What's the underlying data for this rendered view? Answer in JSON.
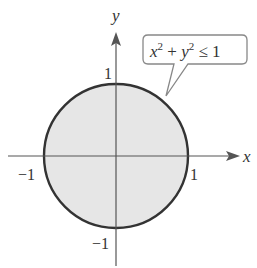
{
  "diagram": {
    "type": "region-plot",
    "axes": {
      "x_label": "x",
      "y_label": "y",
      "x_ticks": [
        {
          "value": -1,
          "label": "−1"
        },
        {
          "value": 1,
          "label": "1"
        }
      ],
      "y_ticks": [
        {
          "value": 1,
          "label": "1"
        },
        {
          "value": -1,
          "label": "−1"
        }
      ]
    },
    "region": {
      "shape": "circle",
      "center": [
        0,
        0
      ],
      "radius": 1,
      "fill_color": "#e6e6e6",
      "stroke_color": "#333333"
    },
    "callout": {
      "text_parts": {
        "x": "x",
        "exp1": "2",
        "plus": " + ",
        "y": "y",
        "exp2": "2",
        "rel": " ≤ 1"
      },
      "full_text": "x² + y² ≤ 1"
    }
  }
}
